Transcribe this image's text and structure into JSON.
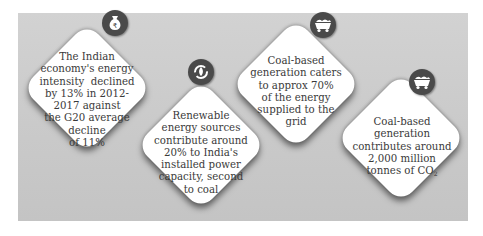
{
  "cards": [
    {
      "icon": "money-bag-rupee-icon",
      "lines": [
        "The Indian",
        "economy's energy",
        "intensity  declined",
        "by 13% in 2012-",
        "2017 against",
        "the G20 average",
        "decline",
        "of 11%"
      ]
    },
    {
      "icon": "renewable-cycle-icon",
      "lines": [
        "Renewable",
        "energy sources",
        "contribute around",
        "20% to India's",
        "installed power",
        "capacity, second",
        "to coal"
      ]
    },
    {
      "icon": "coal-cart-icon",
      "lines": [
        "Coal-based",
        "generation caters",
        "to approx 70%",
        "of the energy",
        "supplied to the",
        "grid"
      ]
    },
    {
      "icon": "coal-cart-icon",
      "lines": [
        "Coal-based",
        "generation",
        "contributes around",
        "2,000 million",
        "tonnes of CO"
      ],
      "subscript": "2"
    }
  ]
}
